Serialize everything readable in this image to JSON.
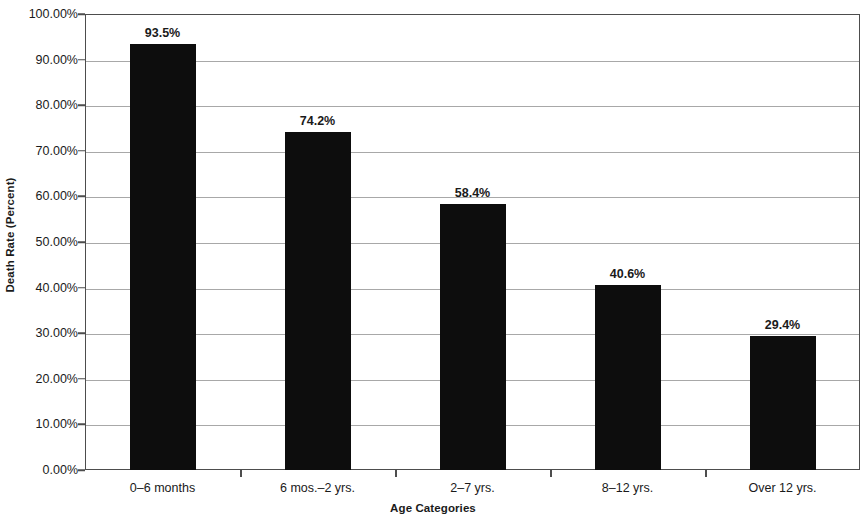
{
  "chart_data": {
    "type": "bar",
    "title": "",
    "xlabel": "Age Categories",
    "ylabel": "Death Rate (Percent)",
    "categories": [
      "0–6 months",
      "6 mos.–2 yrs.",
      "2–7 yrs.",
      "8–12 yrs.",
      "Over 12 yrs."
    ],
    "values": [
      93.5,
      74.2,
      58.4,
      40.6,
      29.4
    ],
    "data_labels": [
      "93.5%",
      "74.2%",
      "58.4%",
      "40.6%",
      "29.4%"
    ],
    "ylim": [
      0,
      100
    ],
    "y_tick_values": [
      0,
      10,
      20,
      30,
      40,
      50,
      60,
      70,
      80,
      90,
      100
    ],
    "y_tick_labels": [
      "0.00%",
      "10.00%",
      "20.00%",
      "30.00%",
      "40.00%",
      "50.00%",
      "60.00%",
      "70.00%",
      "80.00%",
      "90.00%",
      "100.00%"
    ],
    "grid": true,
    "legend": false,
    "legend_position": "none",
    "bar_color": "#0d0d0d",
    "gridline_color": "#a8a8a8",
    "axis_color": "#4d4d4d",
    "background_color": "#ffffff"
  }
}
